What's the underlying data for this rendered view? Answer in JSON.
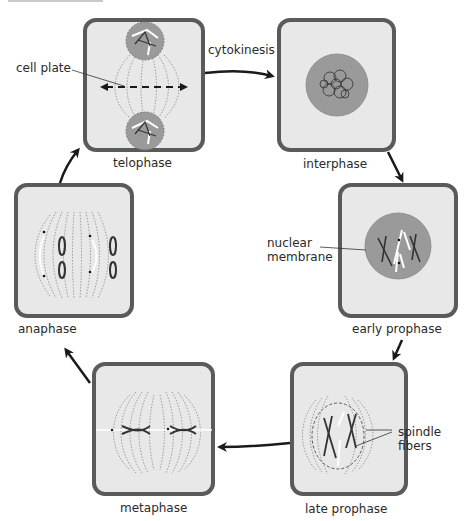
{
  "diagram": {
    "colors": {
      "box_border": "#5a5a5a",
      "box_fill": "#e8e8e8",
      "nucleus_fill": "#9a9a9a",
      "arrow": "#1a1a1a",
      "text": "#2a2a2a"
    },
    "phases": [
      {
        "id": "telophase",
        "label": "telophase"
      },
      {
        "id": "interphase",
        "label": "interphase"
      },
      {
        "id": "early-prophase",
        "label": "early prophase"
      },
      {
        "id": "late-prophase",
        "label": "late prophase"
      },
      {
        "id": "metaphase",
        "label": "metaphase"
      },
      {
        "id": "anaphase",
        "label": "anaphase"
      }
    ],
    "annotations": {
      "cytokinesis": "cytokinesis",
      "cell_plate": "cell plate",
      "nuclear_membrane_line1": "nuclear",
      "nuclear_membrane_line2": "membrane",
      "spindle_fibers_line1": "spindle",
      "spindle_fibers_line2": "fibers"
    },
    "flow": [
      "telophase",
      "interphase",
      "early-prophase",
      "late-prophase",
      "metaphase",
      "anaphase",
      "telophase"
    ]
  }
}
